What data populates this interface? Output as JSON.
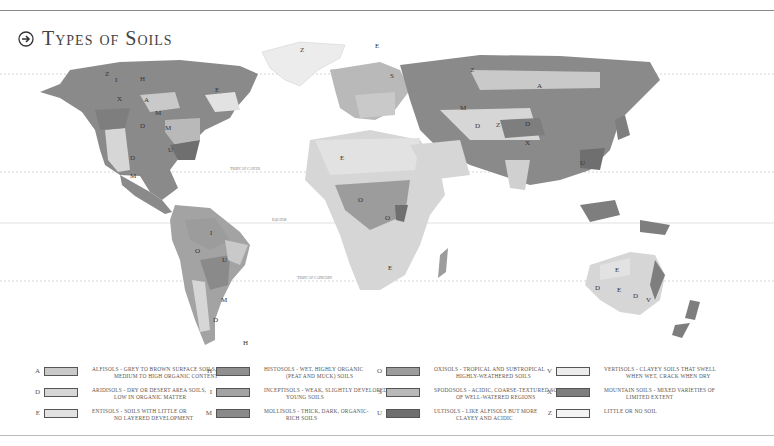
{
  "header": {
    "title": "Types of Soils",
    "icon": "arrow-right-circle-icon"
  },
  "map": {
    "lines": {
      "arctic_circle": "Arctic Circle",
      "tropic_of_cancer": "Tropic of Cancer",
      "equator": "Equator",
      "tropic_of_capricorn": "Tropic of Capricorn"
    }
  },
  "colors": {
    "A": "#c9c9c9",
    "D": "#d6d6d6",
    "E": "#e2e2e2",
    "H": "#8f8f8f",
    "I": "#a3a3a3",
    "M": "#8a8a8a",
    "O": "#9c9c9c",
    "S": "#b9b9b9",
    "U": "#6f6f6f",
    "V": "#d0d0d0",
    "X": "#7e7e7e",
    "Z": "#ececec"
  },
  "legend": [
    {
      "code": "A",
      "name": "Alfisols",
      "line1": "Alfisols - grey to brown surface soils,",
      "line2": "medium to high organic content"
    },
    {
      "code": "D",
      "name": "Aridisols",
      "line1": "Aridisols - dry or desert area soils,",
      "line2": "low in organic matter"
    },
    {
      "code": "E",
      "name": "Entisols",
      "line1": "Entisols - soils with little or",
      "line2": "no layered development"
    },
    {
      "code": "H",
      "name": "Histosols",
      "line1": "Histosols - wet, highly organic",
      "line2": "(peat and muck) soils"
    },
    {
      "code": "I",
      "name": "Inceptisols",
      "line1": "Inceptisols - weak, slightly developed",
      "line2": "young soils"
    },
    {
      "code": "M",
      "name": "Mollisols",
      "line1": "Mollisols - thick, dark, organic-",
      "line2": "rich soils"
    },
    {
      "code": "O",
      "name": "Oxisols",
      "line1": "Oxisols - tropical and subtropical",
      "line2": "highly-weathered soils"
    },
    {
      "code": "S",
      "name": "Spodosols",
      "line1": "Spodosols - acidic, coarse-textured soils",
      "line2": "of well-watered regions"
    },
    {
      "code": "U",
      "name": "Ultisols",
      "line1": "Ultisols - like alfisols but more",
      "line2": "clayey and acidic"
    },
    {
      "code": "V",
      "name": "Vertisols",
      "line1": "Vertisols - clayey soils that swell",
      "line2": "when wet, crack when dry"
    },
    {
      "code": "X",
      "name": "Mountain Soils",
      "line1": "Mountain Soils - mixed varieties of",
      "line2": "limited extent"
    },
    {
      "code": "Z",
      "name": "Little or No Soil",
      "line1": "Little or No Soil",
      "line2": ""
    }
  ]
}
